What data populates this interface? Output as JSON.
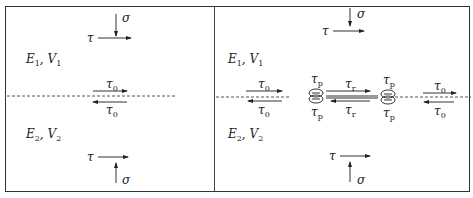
{
  "panels": [
    {
      "id": "left",
      "stress_top": {
        "normal": "σ",
        "shear": "τ"
      },
      "material_top": {
        "E": "E",
        "E_sub": "1",
        "V": "V",
        "V_sub": "1"
      },
      "interface_top": {
        "sym": "τ",
        "sub": "0"
      },
      "interface_bottom": {
        "sym": "τ",
        "sub": "0"
      },
      "material_bottom": {
        "E": "E",
        "E_sub": "2",
        "V": "V",
        "V_sub": "2"
      },
      "stress_bottom": {
        "normal": "σ",
        "shear": "τ"
      }
    },
    {
      "id": "right",
      "stress_top": {
        "normal": "σ",
        "shear": "τ"
      },
      "material_top": {
        "E": "E",
        "E_sub": "1",
        "V": "V",
        "V_sub": "1"
      },
      "material_bottom": {
        "E": "E",
        "E_sub": "2",
        "V": "V",
        "V_sub": "2"
      },
      "left_interface": {
        "sym": "τ",
        "sub": "0"
      },
      "right_interface": {
        "sym": "τ",
        "sub": "0"
      },
      "pinned_left": {
        "sym": "τ",
        "sub": "p"
      },
      "pinned_right": {
        "sym": "τ",
        "sub": "p"
      },
      "released": {
        "sym": "τ",
        "sub": "r"
      },
      "stress_bottom": {
        "normal": "σ",
        "shear": "τ"
      }
    }
  ]
}
